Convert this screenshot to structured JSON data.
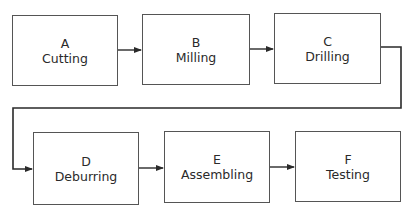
{
  "diagram": {
    "type": "process-flow",
    "steps": [
      {
        "id": "A",
        "letter": "A",
        "label": "Cutting"
      },
      {
        "id": "B",
        "letter": "B",
        "label": "Milling"
      },
      {
        "id": "C",
        "letter": "C",
        "label": "Drilling"
      },
      {
        "id": "D",
        "letter": "D",
        "label": "Deburring"
      },
      {
        "id": "E",
        "letter": "E",
        "label": "Assembling"
      },
      {
        "id": "F",
        "letter": "F",
        "label": "Testing"
      }
    ],
    "edges": [
      {
        "from": "A",
        "to": "B"
      },
      {
        "from": "B",
        "to": "C"
      },
      {
        "from": "C",
        "to": "D"
      },
      {
        "from": "D",
        "to": "E"
      },
      {
        "from": "E",
        "to": "F"
      }
    ],
    "colors": {
      "line": "#2a2a2a",
      "box_border": "#555555",
      "text": "#2a2a2a",
      "background": "#ffffff"
    }
  }
}
